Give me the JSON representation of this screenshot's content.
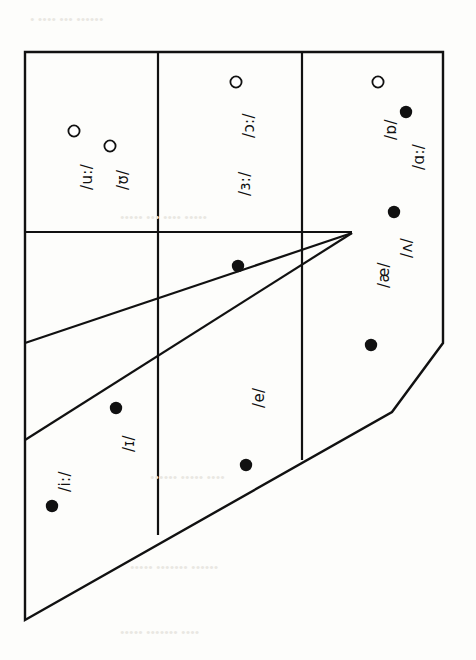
{
  "figure": {
    "kind": "ipa-vowel-quadrilateral",
    "orientation": "rotated-90-clockwise",
    "background_color": "#fdfdfb",
    "line_color": "#111111",
    "filled_marker_color": "#111111",
    "open_marker_color": "#ffffff"
  },
  "legend_semantics": {
    "filled_marker": "unrounded vowel",
    "open_marker": "rounded vowel"
  },
  "chart_data": {
    "type": "scatter",
    "title": "",
    "xlabel": "",
    "ylabel": "",
    "grid": true,
    "legend_position": "none",
    "vowels": [
      {
        "label": "/u:/",
        "marker": "open",
        "x": 74,
        "y": 131,
        "label_x": 78,
        "label_y": 190
      },
      {
        "label": "/ʊ/",
        "marker": "open",
        "x": 110,
        "y": 146,
        "label_x": 114,
        "label_y": 190
      },
      {
        "label": "/ɔ:/",
        "marker": "open",
        "x": 236,
        "y": 82,
        "label_x": 240,
        "label_y": 138
      },
      {
        "label": "/ɒ/",
        "marker": "open",
        "x": 378,
        "y": 82,
        "label_x": 382,
        "label_y": 140
      },
      {
        "label": "/ɑ:/",
        "marker": "filled",
        "x": 406,
        "y": 112,
        "label_x": 410,
        "label_y": 170
      },
      {
        "label": "/ʌ/",
        "marker": "filled",
        "x": 394,
        "y": 212,
        "label_x": 398,
        "label_y": 258
      },
      {
        "label": "/æ/",
        "marker": "filled",
        "x": 371,
        "y": 345,
        "label_x": 375,
        "label_y": 288
      },
      {
        "label": "/ɜ:/",
        "marker": "none",
        "x": 0,
        "y": 0,
        "label_x": 236,
        "label_y": 196
      },
      {
        "label": "/e/",
        "marker": "filled",
        "x": 246,
        "y": 465,
        "label_x": 250,
        "label_y": 408
      },
      {
        "label": "/ɪ/",
        "marker": "filled",
        "x": 116,
        "y": 408,
        "label_x": 120,
        "label_y": 452
      },
      {
        "label": "/i:/",
        "marker": "filled",
        "x": 52,
        "y": 506,
        "label_x": 56,
        "label_y": 492
      },
      {
        "label": "",
        "marker": "filled",
        "x": 238,
        "y": 266,
        "label_x": 0,
        "label_y": 0
      }
    ],
    "outline_points": "25,52 443,52 443,343 392,412 25,620",
    "gridlines": {
      "vertical": [
        {
          "x": 158,
          "y1": 52,
          "y2": 535
        },
        {
          "x": 302,
          "y1": 52,
          "y2": 460
        }
      ],
      "horizontal": [
        {
          "y": 232,
          "x1": 25,
          "x2": 352
        }
      ],
      "converging": [
        {
          "x1": 25,
          "y1": 343,
          "x2": 352,
          "y2": 233
        },
        {
          "x1": 25,
          "y1": 440,
          "x2": 352,
          "y2": 233
        }
      ]
    }
  },
  "background_bleed_text": {
    "note": "faint show-through text from reverse of printed page",
    "lines": [
      {
        "text": "• •••• ••• ••••••",
        "x": 30,
        "y": 12
      },
      {
        "text": "••••• ••• •••• •••••",
        "x": 120,
        "y": 210
      },
      {
        "text": "•••••• ••••• ••••",
        "x": 150,
        "y": 470
      },
      {
        "text": "••••• ••••••• ••••••",
        "x": 130,
        "y": 560
      },
      {
        "text": "••••• ••••••• ••••",
        "x": 120,
        "y": 625
      }
    ]
  }
}
